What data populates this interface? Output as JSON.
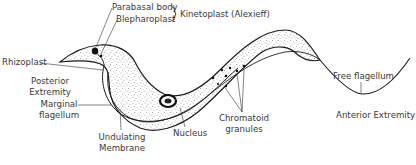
{
  "diagram": {
    "colors": {
      "ink": "#1a1a1a",
      "label": "#3a3a3a",
      "background": "#ffffff",
      "stipple": "#555555"
    },
    "labels": {
      "parabasal_body": "Parabasal body",
      "blepharoplast": "Blepharoplast",
      "kinetoplast": "Kinetoplast (Alexieff)",
      "rhizoplast": "Rhizoplast",
      "posterior_1": "Posterior",
      "posterior_2": "Extremity",
      "marginal_1": "Marginal",
      "marginal_2": "flagellum",
      "undulating_1": "Undulating",
      "undulating_2": "Membrane",
      "nucleus": "Nucleus",
      "chromatoid_1": "Chromatoid",
      "chromatoid_2": "granules",
      "free_flagellum": "Free flagellum",
      "anterior_extremity": "Anterior Extremity"
    }
  }
}
